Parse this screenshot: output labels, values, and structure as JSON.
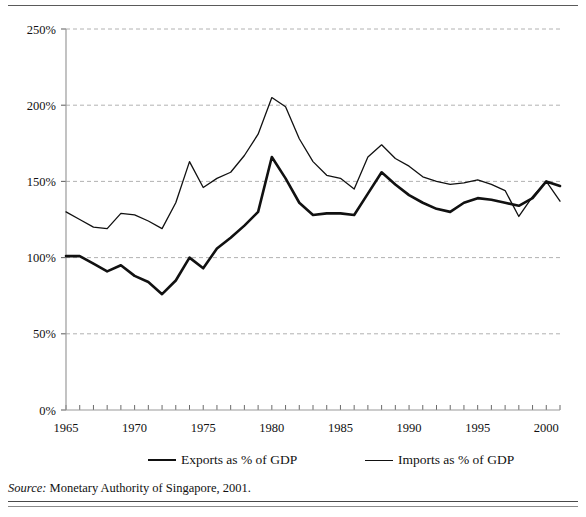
{
  "figure": {
    "source_label": "Source:",
    "source_text": "Monetary Authority of Singapore, 2001."
  },
  "legend": {
    "exports_label": "Exports as % of GDP",
    "imports_label": "Imports as % of GDP"
  },
  "chart_data": {
    "type": "line",
    "title": "",
    "subtitle": "",
    "xlabel": "",
    "ylabel": "",
    "xlim": [
      1965,
      2001
    ],
    "ylim": [
      0,
      250
    ],
    "grid": true,
    "grid_axis": "y",
    "legend_position": "bottom",
    "y_tick_labels": [
      "0%",
      "50%",
      "100%",
      "150%",
      "200%",
      "250%"
    ],
    "y_ticks": [
      0,
      50,
      100,
      150,
      200,
      250
    ],
    "x_tick_labels": [
      "1965",
      "1970",
      "1975",
      "1980",
      "1985",
      "1990",
      "1995",
      "2000"
    ],
    "x_ticks": [
      1965,
      1970,
      1975,
      1980,
      1985,
      1990,
      1995,
      2000
    ],
    "x_minor_tick_step": 1,
    "x": [
      1965,
      1966,
      1967,
      1968,
      1969,
      1970,
      1971,
      1972,
      1973,
      1974,
      1975,
      1976,
      1977,
      1978,
      1979,
      1980,
      1981,
      1982,
      1983,
      1984,
      1985,
      1986,
      1987,
      1988,
      1989,
      1990,
      1991,
      1992,
      1993,
      1994,
      1995,
      1996,
      1997,
      1998,
      1999,
      2000,
      2001
    ],
    "series": [
      {
        "name": "Exports as % of GDP",
        "color": "#111111",
        "line_width": 2.6,
        "values": [
          101,
          101,
          96,
          91,
          95,
          88,
          84,
          76,
          85,
          100,
          93,
          106,
          113,
          121,
          130,
          166,
          152,
          136,
          128,
          129,
          129,
          128,
          142,
          156,
          148,
          141,
          136,
          132,
          130,
          136,
          139,
          138,
          136,
          134,
          139,
          150,
          147
        ]
      },
      {
        "name": "Imports as % of GDP",
        "color": "#111111",
        "line_width": 1.3,
        "values": [
          130,
          125,
          120,
          119,
          129,
          128,
          124,
          119,
          136,
          163,
          146,
          152,
          156,
          167,
          181,
          205,
          199,
          178,
          163,
          154,
          152,
          145,
          166,
          174,
          165,
          160,
          153,
          150,
          148,
          149,
          151,
          148,
          144,
          127,
          140,
          150,
          137
        ]
      }
    ]
  }
}
